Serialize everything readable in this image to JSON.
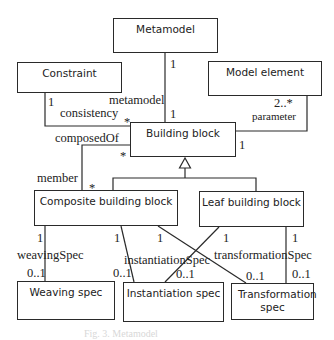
{
  "diagram": {
    "type": "UML class diagram",
    "classes": {
      "metamodel": "Metamodel",
      "constraint": "Constraint",
      "model_element": "Model element",
      "building_block": "Building block",
      "composite_building_block": "Composite building block",
      "leaf_building_block": "Leaf building block",
      "weaving_spec": "Weaving spec",
      "instantiation_spec": "Instantiation spec",
      "transformation_spec": "Transformation spec"
    },
    "associations": {
      "metamodel_bb": {
        "role": "metamodel",
        "mult_top": "1",
        "mult_bottom": "1"
      },
      "constraint_bb": {
        "role": "consistency",
        "mult_constraint": "1",
        "mult_bb": "*"
      },
      "model_element_bb": {
        "role": "parameter",
        "mult_model_element": "2..*",
        "mult_bb": "1"
      },
      "composite_bb": {
        "role_top": "composedOf",
        "role_bottom": "member",
        "mult_bb": "*",
        "mult_composite": "*"
      },
      "weaving": {
        "role": "weavingSpec",
        "mult_source": "1",
        "mult_target": "0..1"
      },
      "instantiation": {
        "role": "instantiationSpec",
        "mult_composite": "1",
        "mult_leaf": "1",
        "mult_target_left": "0..1",
        "mult_target_right": "0..1"
      },
      "transformation": {
        "role": "transformationSpec",
        "mult_composite": "1",
        "mult_leaf": "1",
        "mult_target_left": "0..1",
        "mult_target_right": "0..1"
      }
    },
    "caption": "Fig. 3. Metamodel"
  }
}
